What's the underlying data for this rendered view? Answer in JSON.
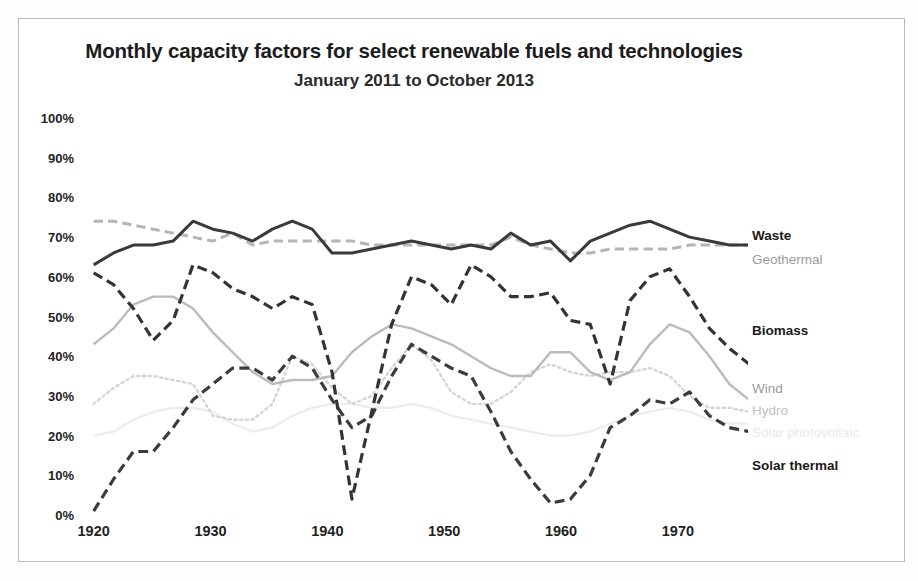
{
  "chart_data": {
    "type": "line",
    "title": "Monthly capacity factors for select renewable fuels and technologies",
    "subtitle": "January 2011 to October 2013",
    "xlabel": "",
    "ylabel": "",
    "ylim": [
      0,
      100
    ],
    "xlim": [
      1919,
      1976
    ],
    "grid": false,
    "legend_position": "right-inline-end-labels",
    "y_ticks": [
      "0%",
      "10%",
      "20%",
      "30%",
      "40%",
      "50%",
      "60%",
      "70%",
      "80%",
      "90%",
      "100%"
    ],
    "y_tick_values": [
      0,
      10,
      20,
      30,
      40,
      50,
      60,
      70,
      80,
      90,
      100
    ],
    "x_ticks": [
      "1920",
      "1930",
      "1940",
      "1950",
      "1960",
      "1970"
    ],
    "x_tick_values": [
      1920,
      1930,
      1940,
      1950,
      1960,
      1970
    ],
    "x": [
      1920,
      1921.7,
      1923.4,
      1925.1,
      1926.8,
      1928.5,
      1930.2,
      1931.9,
      1933.6,
      1935.3,
      1937,
      1938.7,
      1940.4,
      1942.1,
      1943.8,
      1945.5,
      1947.2,
      1948.9,
      1950.6,
      1952.3,
      1954,
      1955.7,
      1957.4,
      1959.1,
      1960.8,
      1962.5,
      1964.2,
      1965.9,
      1967.6,
      1969.3,
      1971,
      1972.7,
      1974.4,
      1976.1
    ],
    "series": [
      {
        "name": "Waste",
        "color": "#3a3a3a",
        "style": "solid",
        "width": 3,
        "values": [
          63,
          66,
          68,
          68,
          69,
          74,
          72,
          71,
          69,
          72,
          74,
          72,
          66,
          66,
          67,
          68,
          69,
          68,
          67,
          68,
          67,
          71,
          68,
          69,
          64,
          69,
          71,
          73,
          74,
          72,
          70,
          69,
          68,
          68
        ]
      },
      {
        "name": "Geothermal",
        "color": "#b5b5b5",
        "style": "dashed",
        "width": 3,
        "values": [
          74,
          74,
          73,
          72,
          71,
          70,
          69,
          71,
          68,
          69,
          69,
          69,
          69,
          69,
          68,
          68,
          68,
          68,
          68,
          68,
          68,
          70,
          68,
          67,
          66,
          66,
          67,
          67,
          67,
          67,
          68,
          68,
          68,
          68
        ]
      },
      {
        "name": "Biomass",
        "color": "#333333",
        "style": "dashed",
        "width": 3.2,
        "values": [
          61,
          58,
          52,
          44,
          49,
          63,
          61,
          57,
          55,
          52,
          55,
          53,
          36,
          4,
          26,
          48,
          60,
          58,
          53,
          63,
          60,
          55,
          55,
          56,
          49,
          48,
          33,
          54,
          60,
          62,
          55,
          47,
          42,
          38
        ]
      },
      {
        "name": "Wind",
        "color": "#bbbbbb",
        "style": "solid",
        "width": 2.4,
        "values": [
          43,
          47,
          53,
          55,
          55,
          52,
          46,
          41,
          36,
          33,
          34,
          34,
          35,
          41,
          45,
          48,
          47,
          45,
          43,
          40,
          37,
          35,
          35,
          41,
          41,
          36,
          34,
          36,
          43,
          48,
          46,
          40,
          33,
          29
        ]
      },
      {
        "name": "Hydro",
        "color": "#d5d5d5",
        "style": "dotted",
        "width": 2.4,
        "values": [
          28,
          32,
          35,
          35,
          34,
          33,
          25,
          24,
          24,
          28,
          40,
          38,
          32,
          28,
          30,
          37,
          43,
          39,
          31,
          28,
          28,
          31,
          36,
          38,
          36,
          35,
          36,
          36,
          37,
          35,
          30,
          27,
          27,
          26
        ]
      },
      {
        "name": "Solar photovoltaic",
        "color": "#ececec",
        "style": "solid",
        "width": 2.2,
        "values": [
          20,
          21,
          24,
          26,
          27,
          27,
          26,
          23,
          21,
          22,
          25,
          27,
          28,
          28,
          27,
          27,
          28,
          27,
          25,
          24,
          23,
          22,
          21,
          20,
          20,
          21,
          23,
          25,
          26,
          27,
          26,
          24,
          23,
          23
        ]
      },
      {
        "name": "Solar thermal",
        "color": "#3c3c3c",
        "style": "dashed",
        "width": 3.2,
        "values": [
          1,
          9,
          16,
          16,
          22,
          29,
          33,
          37,
          37,
          34,
          40,
          37,
          29,
          22,
          25,
          35,
          43,
          40,
          37,
          35,
          26,
          16,
          9,
          3,
          4,
          10,
          22,
          25,
          29,
          28,
          31,
          25,
          22,
          21
        ]
      }
    ],
    "end_labels": [
      {
        "name": "Waste",
        "tone": "dark",
        "x": 752,
        "y": 229
      },
      {
        "name": "Geothermal",
        "tone": "mid",
        "x": 752,
        "y": 253
      },
      {
        "name": "Biomass",
        "tone": "dark",
        "x": 752,
        "y": 324
      },
      {
        "name": "Wind",
        "tone": "mid",
        "x": 752,
        "y": 382
      },
      {
        "name": "Hydro",
        "tone": "light",
        "x": 752,
        "y": 404
      },
      {
        "name": "Solar photovoltaic",
        "tone": "faint",
        "x": 752,
        "y": 426
      },
      {
        "name": "Solar thermal",
        "tone": "dark",
        "x": 752,
        "y": 459
      }
    ]
  },
  "caption": ""
}
